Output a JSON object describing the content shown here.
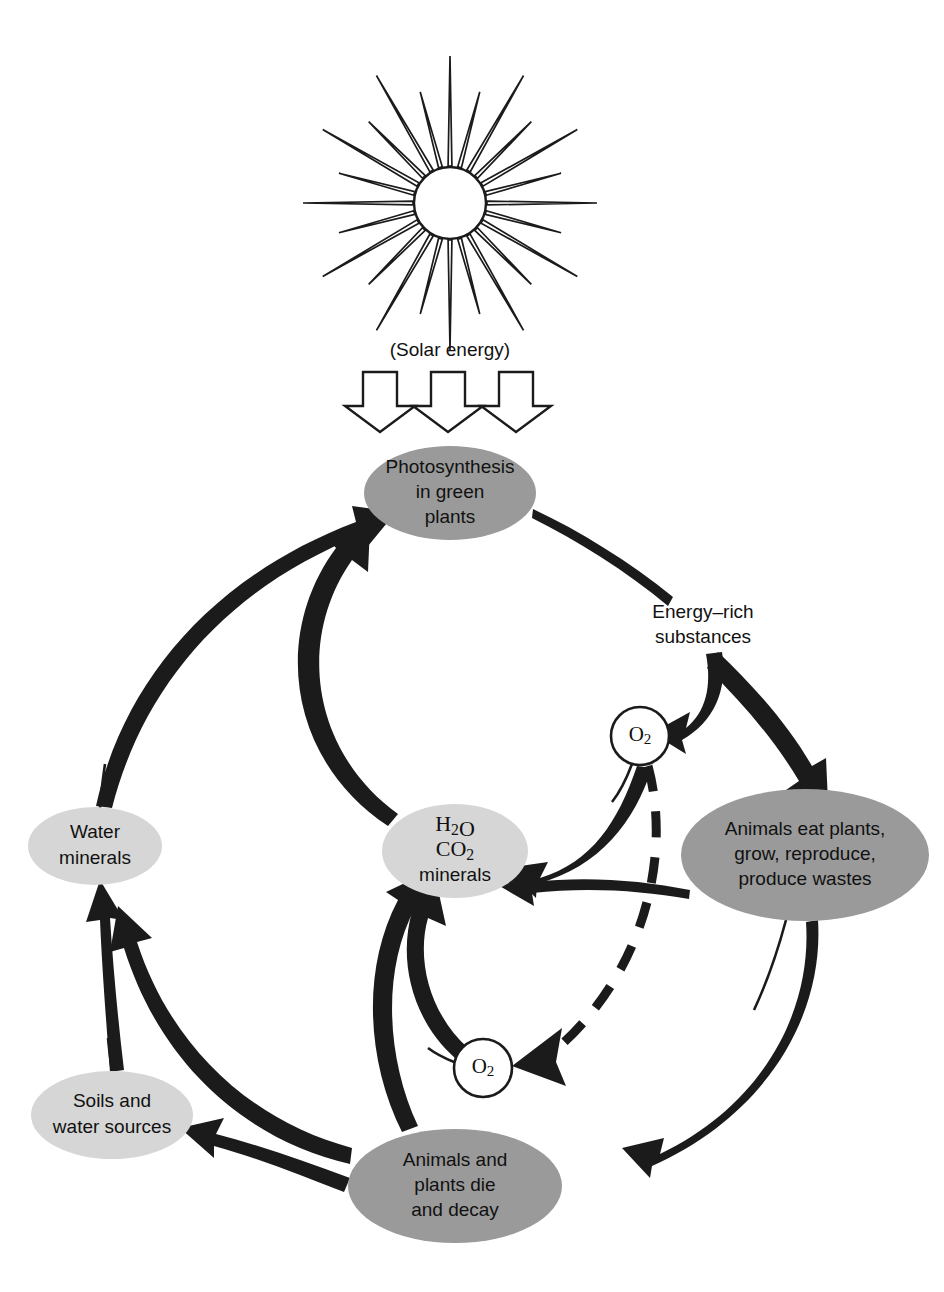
{
  "diagram": {
    "background_color": "#ffffff",
    "ink_color": "#1b1b1b",
    "colors": {
      "ellipse_dark": "#9a9a9a",
      "ellipse_light": "#d6d6d6",
      "outline": "#1b1b1b",
      "paper": "#ffffff"
    },
    "sun": {
      "label": "sun-symbol",
      "ray_count": 24,
      "center_x": 450,
      "center_y": 203,
      "core_radius": 36
    },
    "free_labels": [
      {
        "id": "solar-energy",
        "text": "(Solar energy)",
        "x": 450,
        "y": 351,
        "size": 19
      },
      {
        "id": "energy-rich-line1",
        "text": "Energy–rich",
        "x": 703,
        "y": 613,
        "size": 19
      },
      {
        "id": "energy-rich-line2",
        "text": "substances",
        "x": 703,
        "y": 638,
        "size": 19
      }
    ],
    "solar_arrows": [
      {
        "id": "solar-arrow-1",
        "x": 380
      },
      {
        "id": "solar-arrow-2",
        "x": 448
      },
      {
        "id": "solar-arrow-3",
        "x": 516
      }
    ],
    "nodes": [
      {
        "id": "photosynthesis",
        "name": "photosynthesis-node",
        "lines": [
          "Photosynthesis",
          "in green",
          "plants"
        ],
        "cx": 450,
        "cy": 493,
        "rx": 86,
        "ry": 47,
        "fill": "#9a9a9a",
        "font": "sans",
        "size": 19
      },
      {
        "id": "animals-eat",
        "name": "animals-eat-plants-node",
        "lines": [
          "Animals eat plants,",
          "grow, reproduce,",
          "produce wastes"
        ],
        "cx": 805,
        "cy": 855,
        "rx": 124,
        "ry": 66,
        "fill": "#9a9a9a",
        "font": "sans",
        "size": 19
      },
      {
        "id": "animals-die",
        "name": "animals-plants-die-node",
        "lines": [
          "Animals and",
          "plants die",
          "and decay"
        ],
        "cx": 455,
        "cy": 1186,
        "rx": 107,
        "ry": 57,
        "fill": "#9a9a9a",
        "font": "sans",
        "size": 19
      },
      {
        "id": "h2o-co2",
        "name": "h2o-co2-minerals-node",
        "lines": [
          "H2O",
          "CO2",
          "minerals"
        ],
        "cx": 455,
        "cy": 851,
        "rx": 73,
        "ry": 47,
        "fill": "#d6d6d6",
        "font": "mixed",
        "size": 19
      },
      {
        "id": "water-minerals",
        "name": "water-minerals-node",
        "lines": [
          "Water",
          "minerals"
        ],
        "cx": 95,
        "cy": 846,
        "rx": 67,
        "ry": 39,
        "fill": "#d6d6d6",
        "font": "sans",
        "size": 19
      },
      {
        "id": "soils-water",
        "name": "soils-and-water-sources-node",
        "lines": [
          "Soils and",
          "water sources"
        ],
        "cx": 112,
        "cy": 1115,
        "rx": 81,
        "ry": 44,
        "fill": "#d6d6d6",
        "font": "sans",
        "size": 19
      }
    ],
    "oxygen_nodes": [
      {
        "id": "o2-upper",
        "name": "oxygen-circle-upper",
        "text": "O2",
        "cx": 640,
        "cy": 736,
        "r": 29
      },
      {
        "id": "o2-lower",
        "name": "oxygen-circle-lower",
        "text": "O2",
        "cx": 483,
        "cy": 1068,
        "r": 29
      }
    ],
    "edges": [
      {
        "id": "solar-to-photosynthesis",
        "from": "solar-energy",
        "to": "photosynthesis",
        "style": "block-arrows"
      },
      {
        "id": "photosynthesis-to-energy-rich",
        "from": "photosynthesis",
        "to": "energy-rich-substances",
        "style": "taper"
      },
      {
        "id": "energy-rich-to-o2-upper",
        "from": "energy-rich-substances",
        "to": "o2-upper",
        "style": "thick-arrow"
      },
      {
        "id": "energy-rich-to-animals",
        "from": "energy-rich-substances",
        "to": "animals-eat",
        "style": "thick-arrow"
      },
      {
        "id": "o2-upper-to-h2o-co2",
        "from": "o2-upper",
        "to": "h2o-co2",
        "style": "thick-arrow"
      },
      {
        "id": "animals-to-h2o-co2",
        "from": "animals-eat",
        "to": "h2o-co2",
        "style": "thick-arrow"
      },
      {
        "id": "animals-to-die",
        "from": "animals-eat",
        "to": "animals-die",
        "style": "thick-arrow"
      },
      {
        "id": "o2-upper-to-o2-lower",
        "from": "o2-upper",
        "to": "o2-lower",
        "style": "dashed-arrow"
      },
      {
        "id": "die-to-o2-lower-h2o",
        "from": "animals-die",
        "to": "h2o-co2",
        "style": "thick-arrow"
      },
      {
        "id": "o2-lower-to-h2o-co2",
        "from": "o2-lower",
        "to": "h2o-co2",
        "style": "thick-arrow"
      },
      {
        "id": "die-to-soils",
        "from": "animals-die",
        "to": "soils-water",
        "style": "thick-arrow"
      },
      {
        "id": "die-to-water-minerals",
        "from": "animals-die",
        "to": "water-minerals",
        "style": "thick-arrow"
      },
      {
        "id": "soils-to-water-minerals",
        "from": "soils-water",
        "to": "water-minerals",
        "style": "thick-arrow"
      },
      {
        "id": "water-minerals-to-photosynthesis",
        "from": "water-minerals",
        "to": "photosynthesis",
        "style": "thick-arrow"
      },
      {
        "id": "h2o-co2-to-photosynthesis",
        "from": "h2o-co2",
        "to": "photosynthesis",
        "style": "thick-arrow"
      }
    ]
  }
}
